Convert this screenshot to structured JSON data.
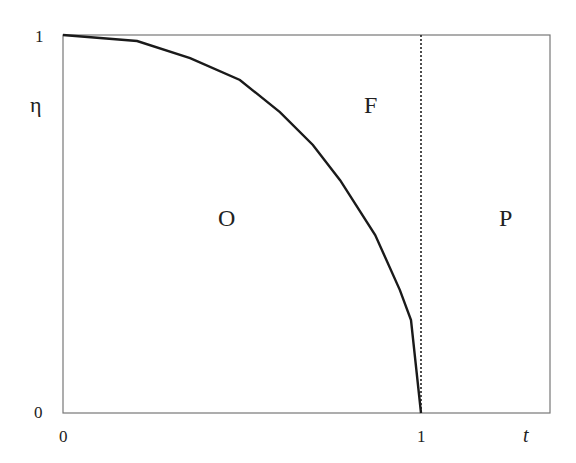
{
  "chart_data": {
    "type": "line",
    "title": "",
    "xlabel": "t",
    "ylabel": "η",
    "xlim": [
      0,
      1.36
    ],
    "ylim": [
      0,
      1
    ],
    "x_ticks": [
      "0",
      "1"
    ],
    "y_ticks": [
      "0",
      "1"
    ],
    "grid": false,
    "series": [
      {
        "name": "boundary curve",
        "style": "solid",
        "x": [
          0,
          0.207,
          0.355,
          0.494,
          0.606,
          0.698,
          0.774,
          0.872,
          0.941,
          0.972,
          1.0
        ],
        "y": [
          1,
          0.984,
          0.939,
          0.881,
          0.796,
          0.709,
          0.616,
          0.471,
          0.325,
          0.246,
          0
        ]
      },
      {
        "name": "t = 1",
        "style": "dotted",
        "x": [
          1,
          1
        ],
        "y": [
          0,
          1
        ]
      }
    ],
    "annotations": [
      {
        "text": "O",
        "x": 0.46,
        "y": 0.52
      },
      {
        "text": "F",
        "x": 0.86,
        "y": 0.79
      },
      {
        "text": "P",
        "x": 1.23,
        "y": 0.52
      }
    ]
  },
  "labels": {
    "x_tick_0": "0",
    "x_tick_1": "1",
    "y_tick_0": "0",
    "y_tick_1": "1",
    "x_axis": "t",
    "y_axis": "η",
    "region_o": "O",
    "region_f": "F",
    "region_p": "P"
  }
}
